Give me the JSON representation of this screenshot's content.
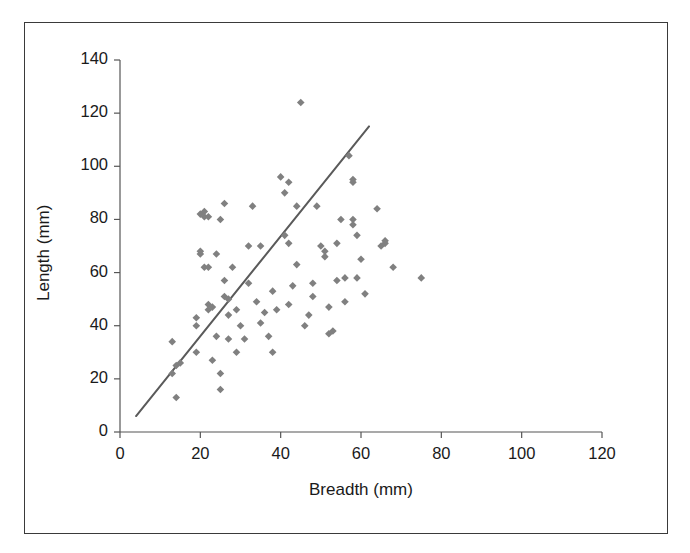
{
  "chart_data": {
    "type": "scatter",
    "title": "",
    "xlabel": "Breadth (mm)",
    "ylabel": "Length (mm)",
    "xlim": [
      0,
      120
    ],
    "ylim": [
      0,
      140
    ],
    "xticks": [
      0,
      20,
      40,
      60,
      80,
      100,
      120
    ],
    "yticks": [
      0,
      20,
      40,
      60,
      80,
      100,
      120,
      140
    ],
    "grid": false,
    "legend": null,
    "marker_color": "#808080",
    "marker_shape": "diamond",
    "marker_size_px": 5,
    "axis_color": "#555555",
    "text_color": "#1a1a1a",
    "frame_color": "#3a3a3a",
    "trendline": {
      "color": "#5a5a5a",
      "width_px": 2,
      "x_start": 4,
      "y_start": 6,
      "x_end": 62,
      "y_end": 115
    },
    "series": [
      {
        "name": "Artefacts",
        "points": [
          [
            13,
            34
          ],
          [
            13,
            22
          ],
          [
            14,
            13
          ],
          [
            14,
            25
          ],
          [
            15,
            26
          ],
          [
            19,
            40
          ],
          [
            19,
            43
          ],
          [
            19,
            30
          ],
          [
            20,
            68
          ],
          [
            20,
            67
          ],
          [
            20,
            82
          ],
          [
            21,
            83
          ],
          [
            21,
            81
          ],
          [
            21,
            62
          ],
          [
            22,
            62
          ],
          [
            22,
            81
          ],
          [
            22,
            48
          ],
          [
            22,
            46
          ],
          [
            23,
            47
          ],
          [
            23,
            27
          ],
          [
            24,
            67
          ],
          [
            24,
            36
          ],
          [
            25,
            80
          ],
          [
            25,
            16
          ],
          [
            25,
            22
          ],
          [
            26,
            57
          ],
          [
            26,
            51
          ],
          [
            26,
            86
          ],
          [
            27,
            50
          ],
          [
            27,
            44
          ],
          [
            27,
            35
          ],
          [
            28,
            62
          ],
          [
            29,
            30
          ],
          [
            29,
            46
          ],
          [
            30,
            40
          ],
          [
            31,
            35
          ],
          [
            32,
            56
          ],
          [
            32,
            70
          ],
          [
            33,
            85
          ],
          [
            34,
            49
          ],
          [
            35,
            70
          ],
          [
            35,
            41
          ],
          [
            36,
            45
          ],
          [
            37,
            36
          ],
          [
            38,
            53
          ],
          [
            38,
            30
          ],
          [
            39,
            46
          ],
          [
            40,
            96
          ],
          [
            41,
            74
          ],
          [
            41,
            90
          ],
          [
            42,
            94
          ],
          [
            42,
            71
          ],
          [
            42,
            48
          ],
          [
            43,
            55
          ],
          [
            44,
            85
          ],
          [
            44,
            63
          ],
          [
            45,
            124
          ],
          [
            46,
            40
          ],
          [
            47,
            44
          ],
          [
            48,
            56
          ],
          [
            48,
            51
          ],
          [
            49,
            85
          ],
          [
            50,
            70
          ],
          [
            51,
            68
          ],
          [
            51,
            66
          ],
          [
            52,
            47
          ],
          [
            52,
            37
          ],
          [
            53,
            38
          ],
          [
            54,
            71
          ],
          [
            54,
            57
          ],
          [
            55,
            80
          ],
          [
            56,
            58
          ],
          [
            56,
            49
          ],
          [
            57,
            104
          ],
          [
            58,
            95
          ],
          [
            58,
            94
          ],
          [
            58,
            78
          ],
          [
            58,
            80
          ],
          [
            59,
            74
          ],
          [
            59,
            58
          ],
          [
            60,
            65
          ],
          [
            61,
            52
          ],
          [
            64,
            84
          ],
          [
            65,
            70
          ],
          [
            66,
            72
          ],
          [
            66,
            71
          ],
          [
            68,
            62
          ],
          [
            75,
            58
          ]
        ]
      }
    ]
  },
  "axes": {
    "x_title": "Breadth (mm)",
    "y_title": "Length (mm)",
    "x_tick_labels": [
      "0",
      "20",
      "40",
      "60",
      "80",
      "100",
      "120"
    ],
    "y_tick_labels": [
      "0",
      "20",
      "40",
      "60",
      "80",
      "100",
      "120",
      "140"
    ]
  }
}
